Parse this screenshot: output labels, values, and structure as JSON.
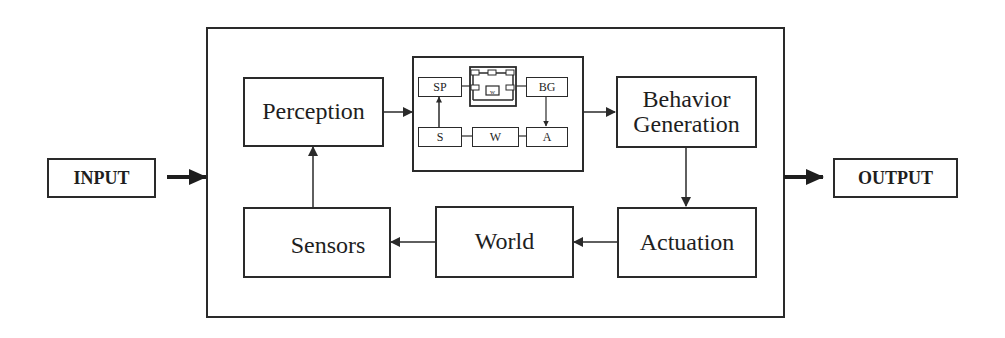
{
  "diagram": {
    "input_label": "INPUT",
    "output_label": "OUTPUT",
    "blocks": {
      "perception": "Perception",
      "behavior_generation": "Behavior Generation",
      "actuation": "Actuation",
      "world": "World",
      "sensors": "Sensors"
    },
    "mini_loop": {
      "sp": "SP",
      "bg": "BG",
      "s": "S",
      "w": "W",
      "a": "A",
      "center_icon": "nested-network-icon"
    },
    "connections": [
      {
        "from": "INPUT",
        "to": "System"
      },
      {
        "from": "Perception",
        "to": "Mini loop"
      },
      {
        "from": "Mini loop",
        "to": "Behavior Generation"
      },
      {
        "from": "Behavior Generation",
        "to": "Actuation"
      },
      {
        "from": "Actuation",
        "to": "World"
      },
      {
        "from": "World",
        "to": "Sensors"
      },
      {
        "from": "Sensors",
        "to": "Perception"
      },
      {
        "from": "System",
        "to": "OUTPUT"
      }
    ],
    "colors": {
      "stroke": "#2a2a2a",
      "background": "#ffffff"
    }
  }
}
